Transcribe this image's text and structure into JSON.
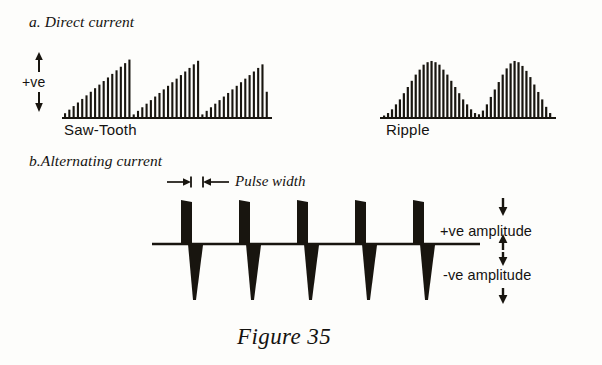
{
  "figure": {
    "caption": "Figure 35",
    "background_color": "#fdfdfb",
    "ink_color": "#18150f"
  },
  "sections": {
    "a": {
      "heading": "a. Direct current",
      "axis_label": "+ve",
      "waveforms": [
        {
          "name": "Saw-Tooth"
        },
        {
          "name": "Ripple"
        }
      ]
    },
    "b": {
      "heading": "b.Alternating current",
      "dimension_label": "Pulse width",
      "positive_amplitude_label": "+ve amplitude",
      "negative_amplitude_label": "-ve amplitude"
    }
  },
  "chart_data": [
    {
      "type": "bar",
      "title": "Saw-Tooth",
      "xlabel": "",
      "ylabel": "+ve",
      "grid": false,
      "legend": "none",
      "note": "Three repeating saw-tooth ramps drawn as a dense picket of vertical lines rising linearly then dropping to zero.",
      "x": [
        0,
        1,
        2,
        3,
        4,
        5,
        6,
        7,
        8,
        9,
        10,
        11,
        12,
        13,
        14,
        15,
        16,
        17,
        18,
        19,
        20,
        21,
        22,
        23,
        24,
        25,
        26,
        27,
        28,
        29,
        30,
        31,
        32,
        33,
        34,
        35,
        36,
        37,
        38,
        39,
        40,
        41,
        42,
        43,
        44,
        45,
        46,
        47
      ],
      "values": [
        4,
        7,
        10,
        13,
        16,
        19,
        22,
        25,
        28,
        31,
        34,
        37,
        40,
        43,
        46,
        49,
        3,
        6,
        9,
        12,
        15,
        18,
        21,
        24,
        27,
        30,
        33,
        36,
        39,
        42,
        45,
        48,
        3,
        6,
        9,
        12,
        15,
        18,
        21,
        24,
        27,
        30,
        33,
        36,
        39,
        42,
        45,
        22
      ],
      "ylim": [
        0,
        52
      ]
    },
    {
      "type": "bar",
      "title": "Ripple",
      "xlabel": "",
      "ylabel": "+ve",
      "grid": false,
      "legend": "none",
      "note": "Two rounded humps drawn as a dense picket of vertical lines; amplitude follows a raised-sine envelope.",
      "x": [
        0,
        1,
        2,
        3,
        4,
        5,
        6,
        7,
        8,
        9,
        10,
        11,
        12,
        13,
        14,
        15,
        16,
        17,
        18,
        19,
        20,
        21,
        22,
        23,
        24,
        25,
        26,
        27,
        28,
        29,
        30,
        31,
        32,
        33,
        34,
        35,
        36,
        37,
        38,
        39,
        40,
        41,
        42
      ],
      "values": [
        2,
        4,
        7,
        11,
        15,
        20,
        25,
        30,
        35,
        39,
        43,
        45,
        46,
        45,
        43,
        39,
        35,
        30,
        25,
        20,
        15,
        11,
        7,
        4,
        3,
        6,
        11,
        17,
        23,
        29,
        35,
        40,
        44,
        46,
        45,
        42,
        38,
        33,
        27,
        21,
        15,
        9,
        4
      ],
      "ylim": [
        0,
        50
      ]
    },
    {
      "type": "line",
      "title": "Alternating current pulse train",
      "xlabel": "",
      "ylabel": "amplitude",
      "grid": false,
      "legend": "none",
      "note": "Five bipolar pulses: a wide positive rectangular pulse tapering slightly, immediately followed by a negative spike tapering to a point.",
      "pulse_count": 5,
      "positive_peak": 1.0,
      "negative_peak": -1.15,
      "ylim": [
        -1.3,
        1.2
      ],
      "pulse_centers": [
        197,
        255,
        313,
        370,
        428
      ]
    }
  ]
}
